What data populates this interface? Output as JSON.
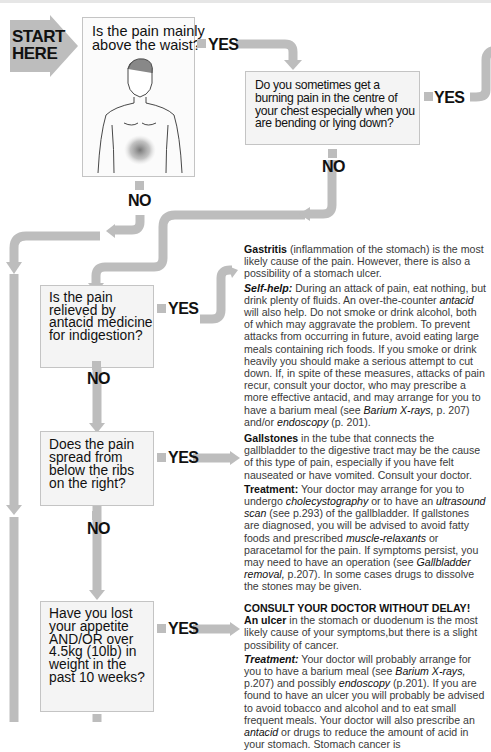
{
  "start": {
    "line1": "START",
    "line2": "HERE"
  },
  "questions": [
    {
      "id": "q1",
      "text": "Is the pain mainly above the waist?",
      "yes_label": "YES",
      "no_label": "NO"
    },
    {
      "id": "q2",
      "text": "Do you sometimes get a burning pain in the centre of your chest especially when you are bending or lying down?",
      "yes_label": "YES",
      "no_label": "NO"
    },
    {
      "id": "q3",
      "text": "Is the pain relieved by antacid medicine for indigestion?",
      "yes_label": "YES",
      "no_label": "NO"
    },
    {
      "id": "q4",
      "text": "Does the pain spread from below the ribs on the right?",
      "yes_label": "YES",
      "no_label": "NO"
    },
    {
      "id": "q5",
      "text": "Have you lost your appetite AND/OR over 4.5kg (10lb) in weight in the past 10 weeks?",
      "yes_label": "YES"
    }
  ],
  "q1_lines": [
    "Is the pain mainly",
    "above the waist?"
  ],
  "q2_lines": [
    "Do you sometimes get a",
    "burning pain in the centre of",
    "your chest especially when you",
    "are bending or lying down?"
  ],
  "q3_lines": [
    "Is the pain",
    "relieved by",
    "antacid medicine",
    "for indigestion?"
  ],
  "q4_lines": [
    "Does the pain",
    "spread from",
    "below the ribs",
    "on the right?"
  ],
  "q5_lines": [
    "Have you lost",
    "your appetite",
    "AND/OR over",
    "4.5kg (10lb) in",
    "weight in the",
    "past 10 weeks?"
  ],
  "labels": {
    "yes": "YES",
    "no": "NO"
  },
  "gastritis": {
    "title": "Gastritis",
    "intro": " (inflammation of the stomach) is the most likely cause of the pain. However, there is also a possibility of a stomach ulcer.",
    "selfhelp_label": "Self-help:",
    "selfhelp_a": " During an attack of pain, eat nothing, but drink plenty of fluids. An over-the-counter ",
    "selfhelp_antacid": "antacid",
    "selfhelp_b": " will also help. Do not smoke or drink alcohol, both of which may aggravate the problem. To prevent attacks from occurring in future, avoid eating large meals containing rich foods. If you smoke or drink heavily you should make a serious attempt to cut down. If, in spite of these measures, attacks of pain recur, consult your doctor, who may prescribe a more effective antacid, and may arrange for you to have a barium meal (see ",
    "selfhelp_ref1": "Barium X-rays,",
    "selfhelp_c": " p. 207) and/or ",
    "selfhelp_ref2": "endoscopy",
    "selfhelp_d": " (p. 201)."
  },
  "gallstones": {
    "title": "Gallstones",
    "intro": " in the tube that connects the gallbladder to the digestive tract may be the cause of this type of pain, especially if you have felt nauseated or have vomited. Consult your doctor.",
    "treatment_label": "Treatment:",
    "t_a": " Your doctor may arrange for you to undergo ",
    "t_ref1": "cholecystography",
    "t_b": " or to have an ",
    "t_ref2": "ultrasound scan",
    "t_c": " (see p.293) of the gallbladder. If gallstones are diagnosed, you will be advised to avoid fatty foods and prescribed ",
    "t_ref3": "muscle-relaxants",
    "t_d": " or paracetamol for the pain. If symptoms persist, you may need to have an operation (see ",
    "t_ref4": "Gallbladder removal,",
    "t_e": " p.207). In some cases drugs to dissolve the stones may be given."
  },
  "ulcer": {
    "headline": "CONSULT YOUR DOCTOR WITHOUT DELAY!",
    "title": "An ulcer",
    "intro": " in the stomach or duodenum is the most likely cause of your symptoms,but there is a slight possibility of cancer.",
    "treatment_label": "Treatment:",
    "t_a": " Your doctor will probably arrange for you to have a barium meal (see ",
    "t_ref1": "Barium X-rays,",
    "t_b": " p.207) and possibly ",
    "t_ref2": "endoscopy",
    "t_c": " (p.201). If you are found to have an ulcer you will probably be advised to avoid tobacco and alcohol and to eat small frequent meals. Your doctor will also prescribe an ",
    "t_ref3": "antacid",
    "t_d": " or drugs to reduce the amount of acid in your stomach. Stomach cancer is"
  },
  "colors": {
    "arrow": "#bdbdbd",
    "box_bg": "#f4f4f4",
    "box_border": "#c4c4c4",
    "text": "#1a1a1a"
  }
}
